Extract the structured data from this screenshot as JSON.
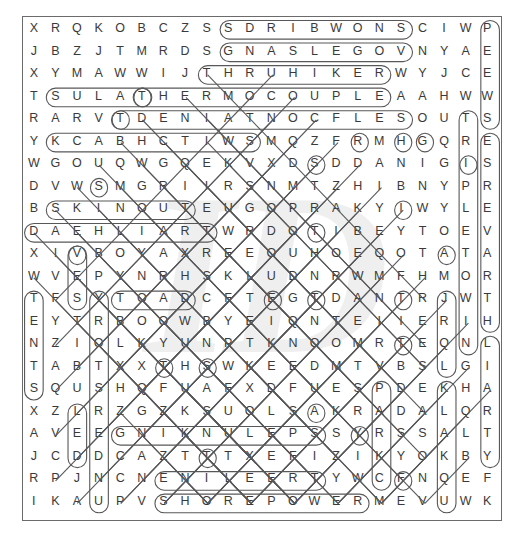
{
  "puzzle": {
    "kind": "word-search-solution-grid",
    "rows": 22,
    "cols": 22,
    "watermark_text": "ID",
    "colors": {
      "letter": "#3a3a3a",
      "oval_stroke": "#58585a",
      "frame": "#6b6b6b",
      "watermark": "#efefef",
      "background": "#ffffff"
    },
    "grid": [
      [
        "X",
        "R",
        "Q",
        "K",
        "O",
        "B",
        "C",
        "Z",
        "S",
        "S",
        "D",
        "R",
        "I",
        "B",
        "W",
        "O",
        "N",
        "S",
        "C",
        "I",
        "W",
        "P"
      ],
      [
        "J",
        "B",
        "Z",
        "J",
        "T",
        "M",
        "R",
        "D",
        "S",
        "G",
        "N",
        "A",
        "S",
        "L",
        "E",
        "G",
        "O",
        "V",
        "N",
        "Y",
        "A",
        "E"
      ],
      [
        "X",
        "Y",
        "M",
        "A",
        "W",
        "W",
        "I",
        "J",
        "T",
        "H",
        "R",
        "U",
        "H",
        "I",
        "K",
        "E",
        "R",
        "W",
        "Y",
        "J",
        "C",
        "E"
      ],
      [
        "T",
        "S",
        "U",
        "L",
        "A",
        "T",
        "H",
        "E",
        "R",
        "M",
        "O",
        "C",
        "O",
        "U",
        "P",
        "L",
        "E",
        "A",
        "A",
        "H",
        "W",
        "W"
      ],
      [
        "R",
        "A",
        "R",
        "V",
        "T",
        "D",
        "E",
        "N",
        "I",
        "A",
        "T",
        "N",
        "O",
        "C",
        "F",
        "L",
        "E",
        "S",
        "O",
        "U",
        "T",
        "S"
      ],
      [
        "Y",
        "K",
        "C",
        "A",
        "B",
        "H",
        "C",
        "T",
        "I",
        "W",
        "S",
        "M",
        "Q",
        "Z",
        "F",
        "R",
        "M",
        "H",
        "G",
        "Q",
        "R",
        "E"
      ],
      [
        "W",
        "G",
        "O",
        "U",
        "Q",
        "W",
        "G",
        "Q",
        "E",
        "K",
        "V",
        "X",
        "D",
        "S",
        "D",
        "D",
        "A",
        "N",
        "I",
        "G",
        "I",
        "S"
      ],
      [
        "D",
        "V",
        "W",
        "S",
        "M",
        "G",
        "R",
        "I",
        "I",
        "R",
        "S",
        "N",
        "M",
        "T",
        "Z",
        "H",
        "I",
        "B",
        "N",
        "Y",
        "P",
        "R"
      ],
      [
        "B",
        "S",
        "K",
        "I",
        "N",
        "O",
        "U",
        "T",
        "E",
        "U",
        "G",
        "O",
        "P",
        "R",
        "A",
        "K",
        "Y",
        "I",
        "W",
        "Y",
        "L",
        "E"
      ],
      [
        "D",
        "A",
        "E",
        "H",
        "L",
        "I",
        "A",
        "R",
        "T",
        "W",
        "R",
        "D",
        "O",
        "T",
        "I",
        "B",
        "E",
        "Y",
        "T",
        "O",
        "E",
        "V"
      ],
      [
        "X",
        "I",
        "V",
        "B",
        "O",
        "Y",
        "A",
        "X",
        "R",
        "E",
        "E",
        "O",
        "U",
        "H",
        "O",
        "E",
        "Q",
        "O",
        "T",
        "A",
        "T",
        "A"
      ],
      [
        "W",
        "V",
        "E",
        "P",
        "Y",
        "N",
        "R",
        "H",
        "S",
        "K",
        "L",
        "U",
        "D",
        "N",
        "R",
        "W",
        "M",
        "F",
        "H",
        "M",
        "O",
        "R"
      ],
      [
        "T",
        "F",
        "S",
        "Y",
        "T",
        "O",
        "A",
        "D",
        "C",
        "F",
        "T",
        "E",
        "G",
        "T",
        "D",
        "A",
        "N",
        "T",
        "R",
        "J",
        "W",
        "T"
      ],
      [
        "E",
        "Y",
        "T",
        "R",
        "B",
        "O",
        "O",
        "W",
        "B",
        "Y",
        "E",
        "I",
        "Q",
        "N",
        "T",
        "E",
        "I",
        "I",
        "E",
        "R",
        "I",
        "H"
      ],
      [
        "N",
        "Z",
        "I",
        "O",
        "L",
        "K",
        "Y",
        "U",
        "N",
        "P",
        "T",
        "K",
        "N",
        "O",
        "O",
        "M",
        "R",
        "T",
        "E",
        "Q",
        "N",
        "L"
      ],
      [
        "T",
        "A",
        "B",
        "T",
        "X",
        "X",
        "T",
        "H",
        "S",
        "W",
        "K",
        "E",
        "E",
        "D",
        "M",
        "T",
        "V",
        "B",
        "S",
        "L",
        "G",
        "I"
      ],
      [
        "S",
        "Q",
        "U",
        "S",
        "H",
        "Q",
        "F",
        "U",
        "A",
        "F",
        "X",
        "D",
        "F",
        "U",
        "E",
        "S",
        "P",
        "D",
        "E",
        "K",
        "H",
        "A"
      ],
      [
        "X",
        "Z",
        "L",
        "R",
        "Z",
        "G",
        "Z",
        "K",
        "S",
        "U",
        "O",
        "L",
        "S",
        "A",
        "K",
        "R",
        "A",
        "D",
        "A",
        "L",
        "Q",
        "R"
      ],
      [
        "A",
        "V",
        "E",
        "E",
        "G",
        "N",
        "I",
        "K",
        "N",
        "U",
        "L",
        "E",
        "P",
        "S",
        "S",
        "Y",
        "R",
        "S",
        "S",
        "A",
        "L",
        "T"
      ],
      [
        "J",
        "C",
        "D",
        "D",
        "C",
        "A",
        "Z",
        "T",
        "T",
        "T",
        "X",
        "E",
        "F",
        "I",
        "Z",
        "I",
        "K",
        "Y",
        "O",
        "K",
        "B",
        "Y"
      ],
      [
        "R",
        "P",
        "J",
        "N",
        "C",
        "N",
        "E",
        "N",
        "I",
        "L",
        "E",
        "E",
        "R",
        "T",
        "Y",
        "W",
        "C",
        "F",
        "N",
        "Q",
        "E",
        "F"
      ],
      [
        "I",
        "K",
        "A",
        "U",
        "P",
        "V",
        "S",
        "H",
        "O",
        "R",
        "E",
        "P",
        "O",
        "W",
        "E",
        "R",
        "M",
        "E",
        "V",
        "U",
        "W",
        "K"
      ]
    ],
    "solutions": [
      {
        "word": "SNOWBIRDS",
        "dir": "reverse-horizontal",
        "row": 0,
        "col_start": 9,
        "col_end": 17
      },
      {
        "word": "VOGELSANG",
        "dir": "reverse-horizontal",
        "row": 1,
        "col_start": 9,
        "col_end": 17
      },
      {
        "word": "THRUHIKER",
        "dir": "horizontal",
        "row": 2,
        "col_start": 8,
        "col_end": 16
      },
      {
        "word": "TALUS",
        "dir": "reverse-horizontal",
        "row": 3,
        "col_start": 1,
        "col_end": 5
      },
      {
        "word": "THERMOCOUPLE",
        "dir": "horizontal",
        "row": 3,
        "col_start": 5,
        "col_end": 16
      },
      {
        "word": "SELFCONTAINED",
        "dir": "reverse-horizontal",
        "row": 4,
        "col_start": 4,
        "col_end": 17
      },
      {
        "word": "SWITCHBACK",
        "dir": "reverse-horizontal",
        "row": 5,
        "col_start": 1,
        "col_end": 10
      },
      {
        "word": "SKINOUT",
        "dir": "horizontal",
        "row": 8,
        "col_start": 1,
        "col_end": 7
      },
      {
        "word": "TRAILHEAD",
        "dir": "reverse-horizontal",
        "row": 9,
        "col_start": 0,
        "col_end": 8
      },
      {
        "word": "TOAD",
        "dir": "horizontal",
        "row": 12,
        "col_start": 4,
        "col_end": 7
      },
      {
        "word": "SPELUNKING",
        "dir": "reverse-horizontal",
        "row": 18,
        "col_start": 4,
        "col_end": 13
      },
      {
        "word": "TREELINE",
        "dir": "reverse-horizontal",
        "row": 20,
        "col_start": 6,
        "col_end": 13
      },
      {
        "word": "SHOREPOWER",
        "dir": "horizontal",
        "row": 21,
        "col_start": 6,
        "col_end": 15
      },
      {
        "word": "PEEWS",
        "dir": "vertical",
        "col": 21,
        "row_start": 0,
        "row_end": 4
      },
      {
        "word": "ESREVART",
        "dir": "vertical",
        "col": 21,
        "row_start": 5,
        "row_end": 13
      },
      {
        "word": "TRAIL",
        "dir": "vertical",
        "col": 21,
        "row_start": 14,
        "row_end": 19
      },
      {
        "word": "TENTS",
        "dir": "vertical",
        "col": 0,
        "row_start": 12,
        "row_end": 16
      },
      {
        "word": "TRIPLET",
        "dir": "vertical",
        "col": 20,
        "row_start": 4,
        "row_end": 14
      },
      {
        "word": "THREES",
        "dir": "vertical",
        "col": 19,
        "row_start": 12,
        "row_end": 15
      },
      {
        "word": "EASON",
        "dir": "vertical",
        "col": 19,
        "row_start": 16,
        "row_end": 21
      },
      {
        "word": "LEE",
        "dir": "vertical",
        "col": 2,
        "row_start": 17,
        "row_end": 19
      },
      {
        "word": "SUSRE",
        "dir": "vertical",
        "col": 3,
        "row_start": 12,
        "row_end": 21
      },
      {
        "word": "VEST",
        "dir": "vertical",
        "col": 2,
        "row_start": 10,
        "row_end": 12
      },
      {
        "word": "PARK",
        "dir": "vertical",
        "col": 16,
        "row_start": 16,
        "row_end": 20
      }
    ]
  }
}
